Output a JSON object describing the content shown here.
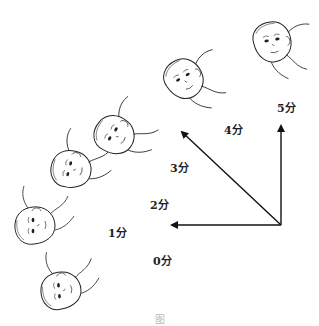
{
  "figure": {
    "labels": [
      {
        "id": "0",
        "text": "0分"
      },
      {
        "id": "1",
        "text": "1分"
      },
      {
        "id": "2",
        "text": "2分"
      },
      {
        "id": "3",
        "text": "3分"
      },
      {
        "id": "4",
        "text": "4分"
      },
      {
        "id": "5",
        "text": "5分"
      }
    ],
    "caption": "图"
  }
}
